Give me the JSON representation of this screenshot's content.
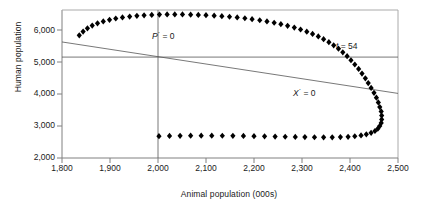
{
  "chart_data": {
    "type": "scatter",
    "title": "",
    "xlabel": "Animal population (000s)",
    "ylabel": "Human population",
    "xlim": [
      1800,
      2500
    ],
    "ylim": [
      2000,
      6400
    ],
    "xticks": [
      "1,800",
      "1,900",
      "2,000",
      "2,100",
      "2,200",
      "2,300",
      "2,400",
      "2,500"
    ],
    "xtick_values": [
      1800,
      1900,
      2000,
      2100,
      2200,
      2300,
      2400,
      2500
    ],
    "yticks": [
      "2,000",
      "3,000",
      "4,000",
      "5,000",
      "6,000"
    ],
    "ytick_values": [
      2000,
      3000,
      4000,
      5000,
      6000
    ],
    "grid": false,
    "legend": "none",
    "marker": "diamond",
    "marker_color": "#000000",
    "series": [
      {
        "name": "trajectory",
        "label": "Predator-prey spiral trajectory",
        "points": [
          [
            1836,
            5648
          ],
          [
            1844,
            5760
          ],
          [
            1853,
            5855
          ],
          [
            1863,
            5936
          ],
          [
            1874,
            6003
          ],
          [
            1886,
            6060
          ],
          [
            1899,
            6108
          ],
          [
            1912,
            6148
          ],
          [
            1926,
            6180
          ],
          [
            1941,
            6206
          ],
          [
            1956,
            6227
          ],
          [
            1971,
            6243
          ],
          [
            1987,
            6255
          ],
          [
            2003,
            6263
          ],
          [
            2019,
            6268
          ],
          [
            2035,
            6269
          ],
          [
            2051,
            6267
          ],
          [
            2068,
            6262
          ],
          [
            2084,
            6255
          ],
          [
            2100,
            6245
          ],
          [
            2117,
            6232
          ],
          [
            2133,
            6217
          ],
          [
            2149,
            6199
          ],
          [
            2165,
            6178
          ],
          [
            2181,
            6154
          ],
          [
            2196,
            6126
          ],
          [
            2212,
            6095
          ],
          [
            2227,
            6060
          ],
          [
            2242,
            6021
          ],
          [
            2256,
            5978
          ],
          [
            2270,
            5930
          ],
          [
            2284,
            5878
          ],
          [
            2297,
            5820
          ],
          [
            2310,
            5757
          ],
          [
            2322,
            5688
          ],
          [
            2334,
            5613
          ],
          [
            2345,
            5532
          ],
          [
            2356,
            5444
          ],
          [
            2366,
            5350
          ],
          [
            2376,
            5249
          ],
          [
            2385,
            5141
          ],
          [
            2394,
            5027
          ],
          [
            2402,
            4906
          ],
          [
            2410,
            4779
          ],
          [
            2418,
            4647
          ],
          [
            2425,
            4510
          ],
          [
            2432,
            4370
          ],
          [
            2438,
            4227
          ],
          [
            2444,
            4082
          ],
          [
            2450,
            3937
          ],
          [
            2455,
            3793
          ],
          [
            2459,
            3652
          ],
          [
            2462,
            3515
          ],
          [
            2465,
            3384
          ],
          [
            2466,
            3261
          ],
          [
            2466,
            3147
          ],
          [
            2465,
            3043
          ],
          [
            2462,
            2951
          ],
          [
            2458,
            2871
          ],
          [
            2452,
            2803
          ],
          [
            2444,
            2748
          ],
          [
            2434,
            2704
          ],
          [
            2423,
            2671
          ],
          [
            2410,
            2647
          ],
          [
            2396,
            2631
          ],
          [
            2380,
            2621
          ],
          [
            2363,
            2616
          ],
          [
            2345,
            2615
          ],
          [
            2326,
            2617
          ],
          [
            2306,
            2621
          ],
          [
            2286,
            2626
          ],
          [
            2265,
            2632
          ],
          [
            2244,
            2638
          ],
          [
            2222,
            2644
          ],
          [
            2200,
            2650
          ],
          [
            2178,
            2655
          ],
          [
            2156,
            2659
          ],
          [
            2134,
            2662
          ],
          [
            2112,
            2664
          ],
          [
            2090,
            2664
          ],
          [
            2068,
            2663
          ],
          [
            2046,
            2660
          ],
          [
            2024,
            2656
          ],
          [
            2002,
            2650
          ]
        ]
      }
    ],
    "isoclines": [
      {
        "name": "P-dot-zero",
        "label": "P* = 0",
        "label_math": "Ṗ = 0",
        "orientation": "vertical",
        "x": 2000,
        "annotation_position": "left-of-line-top",
        "color": "#555555"
      },
      {
        "name": "human-equilibrium",
        "label": "",
        "orientation": "horizontal",
        "y": 5000,
        "color": "#555555"
      },
      {
        "name": "X-dot-zero",
        "label": "X* = 0",
        "label_math": "Ẋ = 0",
        "orientation": "diagonal",
        "from": [
          1800,
          5450
        ],
        "to": [
          2500,
          3920
        ],
        "color": "#555555"
      }
    ],
    "annotations": [
      {
        "name": "p-dot-zero-label",
        "text": "P",
        "sup": "·",
        "eq": " = 0",
        "x": 2000,
        "y": 6050
      },
      {
        "name": "x-dot-zero-label",
        "text": "X",
        "sup": "·",
        "eq": " = 0",
        "x": 2310,
        "y": 4060
      },
      {
        "name": "t-54-label",
        "text": "t",
        "sup": "",
        "eq": " = 54",
        "x": 2395,
        "y": 5350
      }
    ]
  },
  "axis": {
    "ylabel": "Human population",
    "xlabel": "Animal population (000s)",
    "yticks": [
      "6,000",
      "5,000",
      "4,000",
      "3,000",
      "2,000"
    ],
    "xticks": [
      "1,800",
      "1,900",
      "2,000",
      "2,100",
      "2,200",
      "2,300",
      "2,400",
      "2,500"
    ]
  },
  "annotations": {
    "pdot": {
      "var": "P",
      "sup": "·",
      "eq": "= 0"
    },
    "xdot": {
      "var": "X",
      "sup": "·",
      "eq": "= 0"
    },
    "t54": {
      "var": "t",
      "sup": "",
      "eq": "= 54"
    }
  },
  "colors": {
    "marker": "#000000",
    "axis": "#808080",
    "isocline": "#555555",
    "text": "#1a1a1a",
    "background": "#ffffff"
  }
}
